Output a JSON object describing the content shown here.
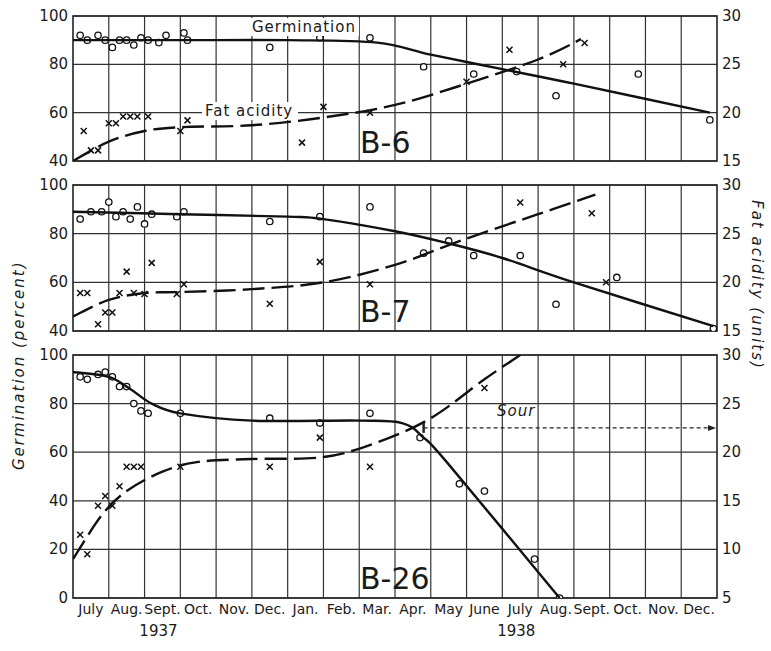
{
  "chart_data": [
    {
      "type": "line",
      "panel": "B-6",
      "title": "B-6",
      "xlabel": "Month (July 1937 – Dec. 1938)",
      "ylabel_left": "Germination (percent)",
      "ylabel_right": "Fat acidity (units)",
      "ylim_left": [
        40,
        100
      ],
      "ylim_right": [
        15,
        30
      ],
      "yticks_left": [
        40,
        60,
        80,
        100
      ],
      "yticks_right": [
        15,
        20,
        25,
        30
      ],
      "grid": true,
      "annotations": [
        "Germination",
        "Fat acidity"
      ],
      "series": [
        {
          "name": "Germination (observed)",
          "marker": "o",
          "axis": "left",
          "x": [
            0.2,
            0.4,
            0.7,
            0.9,
            1.1,
            1.3,
            1.5,
            1.7,
            1.9,
            2.1,
            2.4,
            2.6,
            3.1,
            3.2,
            5.5,
            6.9,
            8.3,
            9.8,
            11.2,
            12.4,
            13.5,
            15.8,
            17.8
          ],
          "y": [
            92,
            90,
            92,
            90,
            87,
            90,
            90,
            88,
            91,
            90,
            89,
            92,
            93,
            90,
            87,
            91,
            91,
            79,
            76,
            77,
            67,
            76,
            57
          ]
        },
        {
          "name": "Germination (fitted curve)",
          "style": "solid",
          "axis": "left",
          "x": [
            0,
            3,
            6,
            8.5,
            10,
            12,
            14,
            17.8
          ],
          "y": [
            90,
            90,
            90,
            89,
            84,
            78,
            72,
            60
          ]
        },
        {
          "name": "Fat acidity (observed)",
          "marker": "x",
          "axis": "right",
          "x": [
            0.3,
            0.5,
            0.7,
            1.0,
            1.2,
            1.4,
            1.6,
            1.8,
            2.1,
            3.0,
            3.2,
            6.4,
            7.0,
            8.3,
            11.0,
            12.2,
            13.7,
            14.3
          ],
          "y": [
            18.1,
            16.1,
            16.1,
            18.9,
            18.9,
            19.6,
            19.6,
            19.6,
            19.6,
            18.1,
            19.2,
            16.9,
            20.6,
            20.0,
            23.2,
            26.5,
            25.0,
            27.2
          ]
        },
        {
          "name": "Fat acidity (fitted curve)",
          "style": "dashed",
          "axis": "right",
          "x": [
            0,
            1,
            2,
            3,
            5,
            7,
            9,
            11,
            13,
            14.2
          ],
          "y": [
            15,
            17,
            18.1,
            18.5,
            18.7,
            19.5,
            20.8,
            23,
            25.5,
            27.6
          ]
        }
      ]
    },
    {
      "type": "line",
      "panel": "B-7",
      "title": "B-7",
      "xlabel": "Month (July 1937 – Dec. 1938)",
      "ylabel_left": "Germination (percent)",
      "ylabel_right": "Fat acidity (units)",
      "ylim_left": [
        40,
        100
      ],
      "ylim_right": [
        15,
        30
      ],
      "yticks_left": [
        40,
        60,
        80,
        100
      ],
      "yticks_right": [
        15,
        20,
        25,
        30
      ],
      "grid": true,
      "series": [
        {
          "name": "Germination (observed)",
          "marker": "o",
          "axis": "left",
          "x": [
            0.2,
            0.5,
            0.8,
            1.0,
            1.2,
            1.4,
            1.6,
            1.8,
            2.0,
            2.2,
            2.9,
            3.1,
            5.5,
            6.9,
            8.3,
            9.8,
            10.5,
            11.2,
            12.5,
            13.5,
            15.2,
            17.9
          ],
          "y": [
            86,
            89,
            89,
            93,
            87,
            89,
            86,
            91,
            84,
            88,
            87,
            89,
            85,
            87,
            91,
            72,
            77,
            71,
            71,
            51,
            62,
            41
          ]
        },
        {
          "name": "Germination (fitted curve)",
          "style": "solid",
          "axis": "left",
          "x": [
            0,
            3,
            6,
            7,
            9,
            10.5,
            12,
            14,
            17.9
          ],
          "y": [
            89,
            88,
            87,
            86,
            81,
            76,
            70,
            60,
            42
          ]
        },
        {
          "name": "Fat acidity (observed)",
          "marker": "x",
          "axis": "right",
          "x": [
            0.2,
            0.4,
            0.7,
            0.9,
            1.1,
            1.3,
            1.5,
            1.7,
            2.0,
            2.2,
            2.9,
            3.1,
            5.5,
            6.9,
            8.3,
            12.5,
            14.5,
            14.9
          ],
          "y": [
            18.9,
            18.9,
            15.7,
            16.9,
            16.9,
            18.9,
            21.1,
            18.9,
            18.8,
            22.0,
            18.8,
            19.8,
            17.8,
            22.1,
            19.8,
            28.2,
            27.1,
            20.0
          ]
        },
        {
          "name": "Fat acidity (fitted curve)",
          "style": "dashed",
          "axis": "right",
          "x": [
            0,
            1,
            2,
            3,
            5,
            7,
            9,
            11,
            13,
            14.6
          ],
          "y": [
            16.5,
            18.2,
            18.9,
            19.0,
            19.3,
            20.0,
            21.8,
            24.5,
            27.0,
            29.0
          ]
        }
      ]
    },
    {
      "type": "line",
      "panel": "B-26",
      "title": "B-26",
      "xlabel": "Month (July 1937 – Dec. 1938)",
      "ylabel_left": "Germination (percent)",
      "ylabel_right": "Fat acidity (units)",
      "ylim_left": [
        0,
        100
      ],
      "ylim_right": [
        5,
        30
      ],
      "yticks_left": [
        0,
        20,
        40,
        60,
        80,
        100
      ],
      "yticks_right": [
        5,
        10,
        15,
        20,
        25,
        30
      ],
      "grid": true,
      "annotations": [
        "Sour"
      ],
      "series": [
        {
          "name": "Germination (observed)",
          "marker": "o",
          "axis": "left",
          "x": [
            0.2,
            0.4,
            0.7,
            0.9,
            1.1,
            1.3,
            1.5,
            1.7,
            1.9,
            2.1,
            3.0,
            5.5,
            6.9,
            8.3,
            9.7,
            10.8,
            11.5,
            12.9,
            13.6
          ],
          "y": [
            91,
            90,
            92,
            93,
            91,
            87,
            87,
            80,
            77,
            76,
            76,
            74,
            72,
            76,
            66,
            47,
            44,
            16,
            0
          ]
        },
        {
          "name": "Germination (fitted curve)",
          "style": "solid",
          "axis": "left",
          "x": [
            0,
            1,
            1.6,
            2.2,
            3,
            5,
            8,
            9.2,
            9.8,
            10.5,
            13.6
          ],
          "y": [
            93,
            91,
            86,
            80,
            76,
            73,
            73,
            72,
            66,
            55,
            0
          ]
        },
        {
          "name": "Fat acidity (observed)",
          "marker": "x",
          "axis": "right",
          "x": [
            0.2,
            0.4,
            0.7,
            0.9,
            1.1,
            1.3,
            1.5,
            1.7,
            1.9,
            3.0,
            5.5,
            6.9,
            8.3,
            11.5
          ],
          "y": [
            11.5,
            9.5,
            14.5,
            15.5,
            14.5,
            16.5,
            18.5,
            18.5,
            18.5,
            18.5,
            18.5,
            21.5,
            18.5,
            26.6
          ]
        },
        {
          "name": "Fat acidity (fitted curve)",
          "style": "dashed",
          "axis": "right",
          "x": [
            0,
            0.8,
            1.5,
            2.5,
            3.5,
            5,
            7,
            8.5,
            10,
            11.5,
            12.5
          ],
          "y": [
            9.0,
            13.5,
            16,
            18,
            19,
            19.3,
            19.5,
            21,
            23.5,
            27.5,
            30
          ]
        },
        {
          "name": "Sour onset marker",
          "style": "dotted-arrow",
          "axis": "right",
          "x": [
            9.8,
            18
          ],
          "y": [
            22.5,
            22.5
          ]
        }
      ]
    }
  ],
  "figure": {
    "panels": [
      "B-6",
      "B-7",
      "B-26"
    ],
    "curve_labels": {
      "germination": "Germination",
      "fat_acidity": "Fat acidity"
    },
    "annotation_sour": "Sour",
    "left_axis_title": "Germination      (percent)",
    "right_axis_title": "Fat      acidity      (units)",
    "months": [
      "July",
      "Aug.",
      "Sept.",
      "Oct.",
      "Nov.",
      "Dec.",
      "Jan.",
      "Feb.",
      "Mar.",
      "Apr.",
      "May",
      "June",
      "July",
      "Aug.",
      "Sept.",
      "Oct.",
      "Nov.",
      "Dec."
    ],
    "years": [
      {
        "label": "1937",
        "under_month_index": 2
      },
      {
        "label": "1938",
        "under_month_index": 12
      }
    ],
    "panel_left_ticks": [
      [
        "100",
        "80",
        "60",
        "40"
      ],
      [
        "100",
        "80",
        "60",
        "40"
      ],
      [
        "100",
        "80",
        "60",
        "40",
        "20",
        "0"
      ]
    ],
    "panel_right_ticks": [
      [
        "30",
        "25",
        "20",
        "15"
      ],
      [
        "30",
        "25",
        "20",
        "15"
      ],
      [
        "30",
        "25",
        "20",
        "15",
        "10",
        "5"
      ]
    ]
  }
}
